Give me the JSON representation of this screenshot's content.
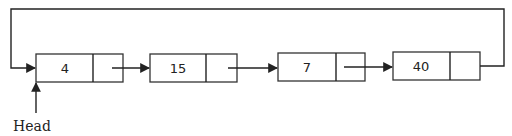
{
  "diagram": {
    "type": "circular-singly-linked-list",
    "nodes": [
      {
        "value": "4"
      },
      {
        "value": "15"
      },
      {
        "value": "7"
      },
      {
        "value": "40"
      }
    ],
    "head_label": "Head",
    "colors": {
      "stroke": "#222222",
      "background": "#ffffff"
    }
  }
}
